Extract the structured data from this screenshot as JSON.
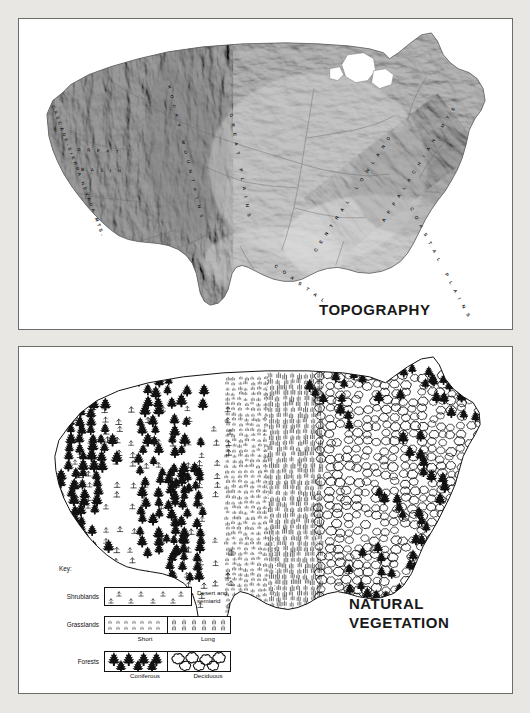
{
  "page": {
    "background_color": "#e9e7e3",
    "panel_background": "#ffffff",
    "border_color": "#6b6b6b",
    "ink_color": "#141414"
  },
  "topography_map": {
    "title": "TOPOGRAPHY",
    "region": "United States",
    "style": "shaded relief, grayscale",
    "labels": [
      {
        "text": "CASCADE-SIERRA NEVADA MTS.",
        "x": 32,
        "y": 86,
        "rotate": 68
      },
      {
        "text": "G R E A T",
        "x": 57,
        "y": 128,
        "rotate": 4
      },
      {
        "text": "B A S I N",
        "x": 61,
        "y": 148,
        "rotate": 2
      },
      {
        "text": "R O C K Y   M O U N T A I N S",
        "x": 147,
        "y": 65,
        "rotate": 74
      },
      {
        "text": "G R E A T   P L A I N S",
        "x": 215,
        "y": 92,
        "rotate": 80
      },
      {
        "text": "C E N T R A L   L O W L A N D",
        "x": 300,
        "y": 228,
        "rotate": -56
      },
      {
        "text": "A P P A L A C H I A N   M T S",
        "x": 378,
        "y": 197,
        "rotate": -58
      },
      {
        "text": "C O A S T A L   P L A I N S",
        "x": 381,
        "y": 196,
        "rotate": 62
      },
      {
        "text": "C O A S T A L",
        "x": 252,
        "y": 247,
        "rotate": 36
      }
    ]
  },
  "vegetation_map": {
    "title": "NATURAL\nVEGETATION",
    "region": "United States",
    "legend": {
      "key_label": "Key:",
      "rows": [
        {
          "label": "Shrublands",
          "swatches": [
            {
              "name": "desert-shrub-swatch",
              "pattern": "shrub"
            }
          ],
          "note": "Desert and\nsemiarid"
        },
        {
          "label": "Grasslands",
          "swatches": [
            {
              "name": "short-grass-swatch",
              "pattern": "short-grass",
              "caption": "Short"
            },
            {
              "name": "long-grass-swatch",
              "pattern": "long-grass",
              "caption": "Long"
            }
          ]
        },
        {
          "label": "Forests",
          "swatches": [
            {
              "name": "coniferous-swatch",
              "pattern": "conifer",
              "caption": "Coniferous"
            },
            {
              "name": "deciduous-swatch",
              "pattern": "deciduous",
              "caption": "Deciduous"
            }
          ]
        }
      ],
      "captions": {
        "short": "Short",
        "long": "Long",
        "coniferous": "Coniferous",
        "deciduous": "Deciduous"
      }
    },
    "symbols": {
      "coniferous": "filled black fir tree",
      "deciduous": "outlined rounded canopy blob",
      "short_grass": "short vertical tick rows",
      "long_grass": "tall vertical stroke rows",
      "shrub": "small inverted-T shrub mark"
    }
  }
}
